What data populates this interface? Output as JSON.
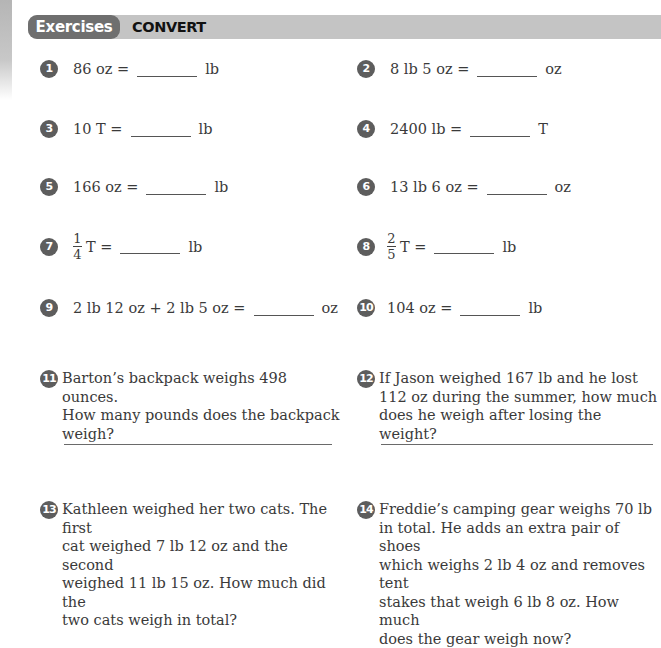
{
  "header": {
    "section_label": "Exercises",
    "title": "CONVERT"
  },
  "colors": {
    "header_bar": "#c4c4c4",
    "header_pill": "#6f6f6f",
    "number_badge": "#5d5d5d",
    "text": "#3a3a3a"
  },
  "problems": [
    {
      "number": "1",
      "left": "86 oz =",
      "unit": "lb"
    },
    {
      "number": "2",
      "left": "8 lb 5 oz =",
      "unit": "oz"
    },
    {
      "number": "3",
      "left": "10 T =",
      "unit": "lb"
    },
    {
      "number": "4",
      "left": "2400 lb =",
      "unit": "T"
    },
    {
      "number": "5",
      "left": "166 oz =",
      "unit": "lb"
    },
    {
      "number": "6",
      "left": "13 lb 6 oz =",
      "unit": "oz"
    },
    {
      "number": "7",
      "frac_num": "1",
      "frac_den": "4",
      "left": "T =",
      "unit": "lb"
    },
    {
      "number": "8",
      "frac_num": "2",
      "frac_den": "5",
      "left": "T =",
      "unit": "lb"
    },
    {
      "number": "9",
      "left": "2 lb 12 oz + 2 lb 5 oz =",
      "unit": "oz"
    },
    {
      "number": "10",
      "left": "104 oz =",
      "unit": "lb"
    }
  ],
  "word_problems": [
    {
      "number": "11",
      "lines": [
        "Barton’s backpack weighs 498 ounces.",
        "How many pounds does the backpack",
        "weigh?"
      ]
    },
    {
      "number": "12",
      "lines": [
        "If Jason weighed 167 lb and he lost",
        "112 oz during the summer, how much",
        "does he weigh after losing the weight?"
      ]
    },
    {
      "number": "13",
      "lines": [
        "Kathleen weighed her two cats. The first",
        "cat weighed 7 lb 12 oz and the second",
        "weighed 11 lb 15 oz. How much did the",
        "two cats weigh in total?"
      ]
    },
    {
      "number": "14",
      "lines": [
        "Freddie’s camping gear weighs 70 lb",
        "in total. He adds an extra pair of shoes",
        "which weighs 2 lb 4 oz and removes tent",
        "stakes that weigh 6 lb 8 oz. How much",
        "does the gear weigh now?"
      ]
    }
  ]
}
